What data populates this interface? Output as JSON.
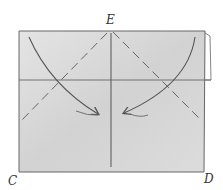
{
  "diagram": {
    "type": "origami-fold-diagram",
    "labels": {
      "top": "E",
      "bottom_left": "C",
      "bottom_right": "D"
    },
    "colors": {
      "paper": "#d6d6d6",
      "paper_light": "#e6e6e6",
      "line": "#555555",
      "background": "#ffffff"
    },
    "elements": [
      {
        "kind": "valley-fold-dashed",
        "from": "E",
        "to": "left-edge"
      },
      {
        "kind": "valley-fold-dashed",
        "from": "E",
        "to": "right-edge"
      },
      {
        "kind": "crease",
        "orientation": "vertical-center"
      },
      {
        "kind": "crease",
        "orientation": "horizontal"
      },
      {
        "kind": "fold-arrow",
        "direction": "top-left-corner-to-center"
      },
      {
        "kind": "fold-arrow",
        "direction": "top-right-corner-to-center"
      }
    ]
  }
}
